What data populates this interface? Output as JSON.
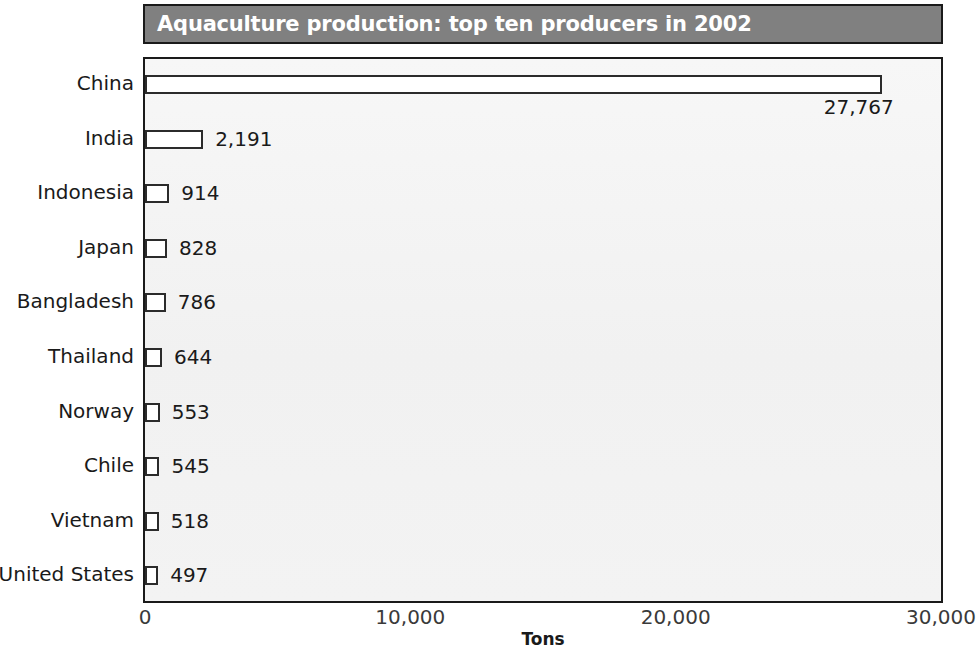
{
  "chart_data": {
    "type": "bar",
    "orientation": "horizontal",
    "title": "Aquaculture production: top ten producers in 2002",
    "xlabel": "Tons",
    "ylabel": "",
    "xlim": [
      0,
      30000
    ],
    "xticks": [
      0,
      10000,
      20000,
      30000
    ],
    "xtick_labels": [
      "0",
      "10,000",
      "20,000",
      "30,000"
    ],
    "grid": false,
    "legend": false,
    "categories": [
      "China",
      "India",
      "Indonesia",
      "Japan",
      "Bangladesh",
      "Thailand",
      "Norway",
      "Chile",
      "Vietnam",
      "United States"
    ],
    "values": [
      27767,
      2191,
      914,
      828,
      786,
      644,
      553,
      545,
      518,
      497
    ],
    "value_labels": [
      "27,767",
      "2,191",
      "914",
      "828",
      "786",
      "644",
      "553",
      "545",
      "518",
      "497"
    ],
    "label_positions": [
      "below",
      "right",
      "right",
      "right",
      "right",
      "right",
      "right",
      "right",
      "right",
      "right"
    ]
  },
  "style": {
    "title_bar_color": "#808080",
    "title_text_color": "#ffffff",
    "plot_background": "#f4f4f4",
    "bar_fill": "#ffffff",
    "bar_outline": "#2b2b2b",
    "axis_color": "#1a1a1a",
    "text_color": "#1a1a1a"
  }
}
